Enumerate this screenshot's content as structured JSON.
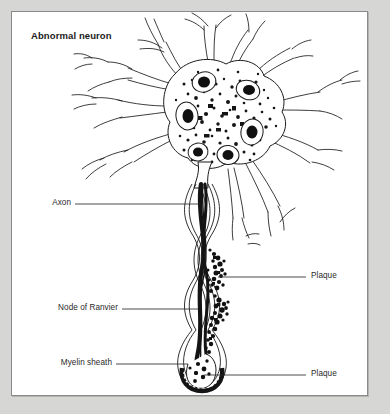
{
  "figure": {
    "title": "Abnormal neuron",
    "background_color": "#d6d6d4",
    "panel_color": "#ffffff",
    "border_color": "#8a8a8a",
    "ink_color": "#1b1b1b"
  },
  "labels": {
    "axon": "Axon",
    "node_of_ranvier": "Node of Ranvier",
    "myelin_sheath": "Myelin sheath",
    "plaque_upper": "Plaque",
    "plaque_lower": "Plaque"
  },
  "diagram": {
    "type": "anatomical-illustration",
    "subject": "abnormal neuron",
    "parts": [
      "cell body",
      "dendrites",
      "nuclei",
      "axon",
      "myelin sheath",
      "node of Ranvier",
      "plaque deposits",
      "axon terminal"
    ]
  }
}
